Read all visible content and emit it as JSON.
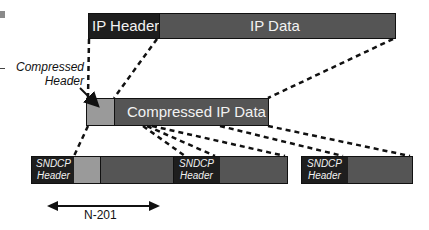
{
  "ip_packet": {
    "header_label": "IP Header",
    "data_label": "IP Data"
  },
  "compressed_packet": {
    "header_annotation_line1": "Compressed",
    "header_annotation_line2": "Header",
    "data_label": "Compressed IP Data"
  },
  "sndcp_packets": [
    {
      "header_line1": "SNDCP",
      "header_line2": "Header"
    },
    {
      "header_line1": "SNDCP",
      "header_line2": "Header"
    },
    {
      "header_line1": "SNDCP",
      "header_line2": "Header"
    }
  ],
  "dimension": {
    "label": "N-201"
  },
  "colors": {
    "dark": "#1e1e1e",
    "mid_gray": "#555555",
    "light_gray": "#9a9a9a",
    "text_on_dark": "#f2f2f2"
  }
}
